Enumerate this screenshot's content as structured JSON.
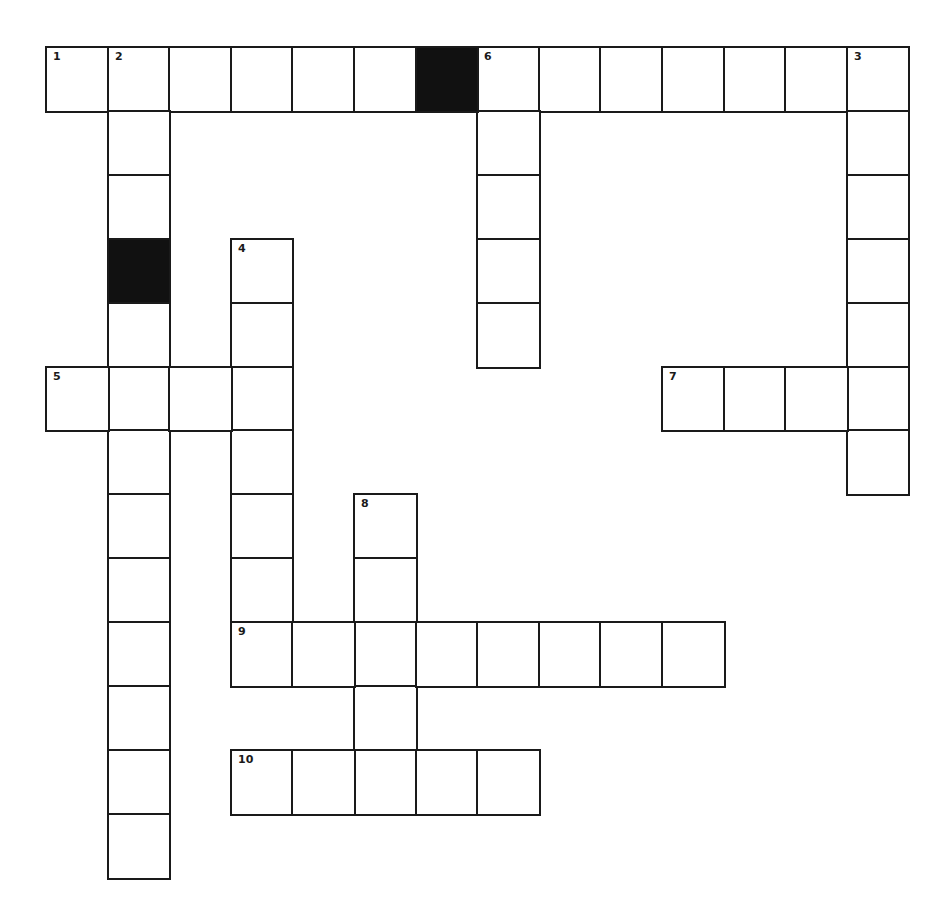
{
  "puzzle": {
    "type": "crossword",
    "grid": {
      "origin_x": 46,
      "origin_y": 47,
      "cell_w": 61.6,
      "cell_h": 63.9,
      "cols": 14,
      "rows": 13,
      "line_color": "#1a1a1a",
      "block_color": "#111111",
      "background": "#ffffff"
    },
    "black_cells": [
      {
        "r": 0,
        "c": 6
      },
      {
        "r": 3,
        "c": 1
      }
    ],
    "entries": [
      {
        "number": "1",
        "direction": "across",
        "row": 0,
        "col": 0,
        "length": 6
      },
      {
        "number": "6",
        "direction": "across",
        "row": 0,
        "col": 7,
        "length": 7
      },
      {
        "number": "2",
        "direction": "down",
        "row": 0,
        "col": 1,
        "length": 13
      },
      {
        "number": "6",
        "direction": "down",
        "row": 0,
        "col": 7,
        "length": 5
      },
      {
        "number": "3",
        "direction": "down",
        "row": 0,
        "col": 13,
        "length": 7
      },
      {
        "number": "4",
        "direction": "down",
        "row": 3,
        "col": 3,
        "length": 7
      },
      {
        "number": "5",
        "direction": "across",
        "row": 5,
        "col": 0,
        "length": 4
      },
      {
        "number": "7",
        "direction": "across",
        "row": 5,
        "col": 10,
        "length": 4
      },
      {
        "number": "8",
        "direction": "down",
        "row": 7,
        "col": 5,
        "length": 5
      },
      {
        "number": "9",
        "direction": "across",
        "row": 9,
        "col": 3,
        "length": 8
      },
      {
        "number": "10",
        "direction": "across",
        "row": 11,
        "col": 3,
        "length": 5
      }
    ],
    "labels": [
      {
        "number": "1",
        "row": 0,
        "col": 0
      },
      {
        "number": "2",
        "row": 0,
        "col": 1
      },
      {
        "number": "6",
        "row": 0,
        "col": 7
      },
      {
        "number": "3",
        "row": 0,
        "col": 13
      },
      {
        "number": "4",
        "row": 3,
        "col": 3
      },
      {
        "number": "5",
        "row": 5,
        "col": 0
      },
      {
        "number": "7",
        "row": 5,
        "col": 10
      },
      {
        "number": "8",
        "row": 7,
        "col": 5
      },
      {
        "number": "9",
        "row": 9,
        "col": 3
      },
      {
        "number": "10",
        "row": 11,
        "col": 3
      }
    ]
  }
}
